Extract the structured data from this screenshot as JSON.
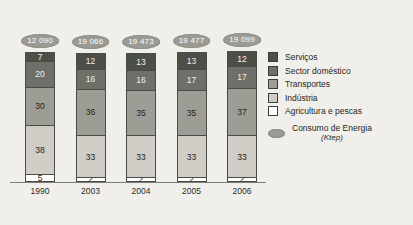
{
  "chart_data": {
    "type": "bar",
    "stacked": true,
    "title": "",
    "xlabel": "",
    "ylabel": "",
    "ylim": [
      0,
      100
    ],
    "grid": false,
    "legend_position": "right",
    "categories": [
      "1990",
      "2003",
      "2004",
      "2005",
      "2006"
    ],
    "series": [
      {
        "name": "Agricultura e pescas",
        "color": "#ffffff",
        "values": [
          5,
          2,
          2,
          2,
          2
        ]
      },
      {
        "name": "Indústria",
        "color": "#cfcdc6",
        "values": [
          38,
          33,
          33,
          33,
          33
        ]
      },
      {
        "name": "Transportes",
        "color": "#9d9d96",
        "values": [
          30,
          36,
          35,
          35,
          37
        ]
      },
      {
        "name": "Sector doméstico",
        "color": "#6f6f69",
        "values": [
          20,
          16,
          16,
          17,
          17
        ]
      },
      {
        "name": "Serviços",
        "color": "#4e4e49",
        "values": [
          7,
          12,
          13,
          13,
          12
        ]
      }
    ],
    "annotations": {
      "name": "Consumo de Energia",
      "unit": "(Ktep)",
      "values": [
        "12 090",
        "19 066",
        "19 473",
        "19 477",
        "19 099"
      ]
    }
  },
  "legend": {
    "items": [
      {
        "label": "Serviços",
        "color": "#4e4e49"
      },
      {
        "label": "Sector doméstico",
        "color": "#6f6f69"
      },
      {
        "label": "Transportes",
        "color": "#9d9d96"
      },
      {
        "label": "Indústria",
        "color": "#cfcdc6"
      },
      {
        "label": "Agricultura e pescas",
        "color": "#ffffff"
      }
    ],
    "energy": {
      "label": "Consumo de Energia",
      "unit": "(Ktep)",
      "color": "#9b9b94"
    }
  }
}
